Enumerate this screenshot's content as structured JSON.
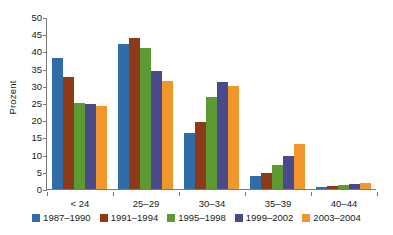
{
  "chart_data": {
    "type": "bar",
    "title": "",
    "xlabel": "",
    "ylabel": "Prozent",
    "ylim": [
      0,
      50
    ],
    "yticks": [
      0,
      5,
      10,
      15,
      20,
      25,
      30,
      35,
      40,
      45,
      50
    ],
    "grid": false,
    "legend_position": "bottom",
    "categories": [
      "< 24",
      "25–29",
      "30–34",
      "35–39",
      "40–44"
    ],
    "series": [
      {
        "name": "1987–1990",
        "color": "#2F6CA8",
        "values": [
          38.0,
          42.1,
          16.2,
          3.9,
          0.7
        ]
      },
      {
        "name": "1991–1994",
        "color": "#8C3A17",
        "values": [
          32.5,
          43.8,
          19.5,
          4.7,
          0.9
        ]
      },
      {
        "name": "1995–1998",
        "color": "#5C9B32",
        "values": [
          25.1,
          40.9,
          26.7,
          7.0,
          1.1
        ]
      },
      {
        "name": "1999–2002",
        "color": "#494A8B",
        "values": [
          24.6,
          34.2,
          31.0,
          9.7,
          1.4
        ]
      },
      {
        "name": "2003–2004",
        "color": "#F0962B",
        "values": [
          24.0,
          31.3,
          30.0,
          13.0,
          1.7
        ]
      }
    ]
  }
}
